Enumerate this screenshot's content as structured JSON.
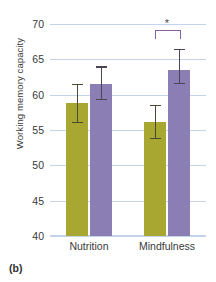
{
  "panel_label": "(b)",
  "chart_data": {
    "type": "bar",
    "title": "",
    "xlabel": "",
    "ylabel": "Working memory capacity",
    "categories": [
      "Nutrition",
      "Mindfulness"
    ],
    "ylim": [
      40,
      70
    ],
    "yticks": [
      40,
      45,
      50,
      55,
      60,
      65,
      70
    ],
    "ytick_labels": [
      "40",
      "45",
      "50",
      "55",
      "60",
      "65",
      "70"
    ],
    "grid": true,
    "legend": "none",
    "series": [
      {
        "name": "pre",
        "color": "#a7a731",
        "values": [
          58.8,
          56.2
        ],
        "err_low": [
          56.0,
          53.7
        ],
        "err_high": [
          61.5,
          58.6
        ]
      },
      {
        "name": "post",
        "color": "#8a7eb4",
        "values": [
          61.5,
          63.5
        ],
        "err_low": [
          59.2,
          61.5
        ],
        "err_high": [
          64.0,
          66.5
        ]
      }
    ],
    "annotations": [
      {
        "type": "significance-bracket",
        "label": "*",
        "group": "Mindfulness",
        "from_series": "pre",
        "to_series": "post",
        "y": 69.2,
        "color": "#8a5f9e"
      }
    ]
  }
}
